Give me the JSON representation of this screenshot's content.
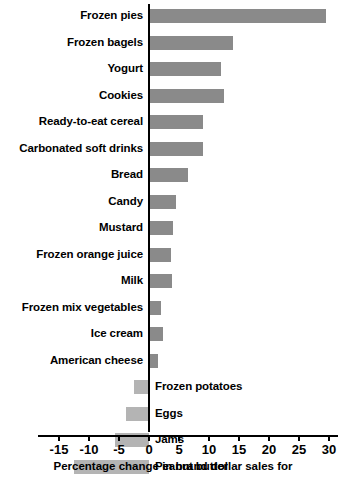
{
  "chart_data": {
    "type": "bar",
    "orientation": "horizontal",
    "title": "",
    "xlabel": "Percentage change in brand dollar sales for",
    "ylabel": "",
    "xlim": [
      -15,
      30
    ],
    "xticks": [
      -15,
      -10,
      -5,
      0,
      5,
      10,
      15,
      20,
      25,
      30
    ],
    "xtick_labels": [
      "-15",
      "-10",
      "-5",
      "0",
      "5",
      "10",
      "15",
      "20",
      "25",
      "30"
    ],
    "grid": false,
    "legend": null,
    "categories": [
      "Frozen pies",
      "Frozen bagels",
      "Yogurt",
      "Cookies",
      "Ready-to-eat cereal",
      "Carbonated soft drinks",
      "Bread",
      "Candy",
      "Mustard",
      "Frozen orange juice",
      "Milk",
      "Frozen mix vegetables",
      "Ice cream",
      "American cheese",
      "Frozen potatoes",
      "Eggs",
      "Jams",
      "Peanut butter"
    ],
    "values": [
      29.5,
      14.0,
      12.0,
      12.5,
      9.0,
      9.0,
      6.5,
      4.5,
      4.0,
      3.7,
      3.8,
      2.0,
      2.3,
      1.5,
      -2.5,
      -3.8,
      -5.7,
      -12.5
    ],
    "colors": {
      "positive_bar": "#8a8a8a",
      "negative_bar": "#b4b4b4",
      "axis": "#000000",
      "text": "#000000",
      "background": "#ffffff"
    }
  }
}
